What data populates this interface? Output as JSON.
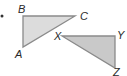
{
  "diagram": {
    "bullet": {
      "x": 2,
      "y": 16
    },
    "colors": {
      "fill1": "#dcdcdc",
      "fill2": "#c9c9c9",
      "stroke": "#8a8a8a",
      "text": "#2a2a2a"
    },
    "triangles": [
      {
        "name": "ABC",
        "vertices": {
          "A": [
            23,
            47
          ],
          "B": [
            23,
            16
          ],
          "C": [
            75,
            16
          ]
        },
        "labels": [
          {
            "text": "B",
            "x": 18,
            "y": 13
          },
          {
            "text": "C",
            "x": 80,
            "y": 20
          },
          {
            "text": "A",
            "x": 15,
            "y": 58
          }
        ]
      },
      {
        "name": "XYZ",
        "vertices": {
          "X": [
            62,
            36
          ],
          "Y": [
            115,
            36
          ],
          "Z": [
            115,
            68
          ]
        },
        "labels": [
          {
            "text": "X",
            "x": 54,
            "y": 40
          },
          {
            "text": "Y",
            "x": 117,
            "y": 39
          },
          {
            "text": "Z",
            "x": 113,
            "y": 76
          }
        ]
      }
    ]
  }
}
